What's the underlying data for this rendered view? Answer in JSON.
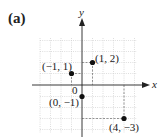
{
  "figure": {
    "panel_label": "(a)",
    "x_axis_label": "x",
    "y_axis_label": "y",
    "origin_label": "0"
  },
  "points": [
    {
      "label": "(1, 2)",
      "x": 1,
      "y": 2
    },
    {
      "label": "(−1, 1)",
      "x": -1,
      "y": 1
    },
    {
      "label": "(0, −1)",
      "x": 0,
      "y": -1
    },
    {
      "label": "(4, −3)",
      "x": 4,
      "y": -3
    }
  ],
  "colors": {
    "axis": "#222222",
    "grid": "#c8c8c8",
    "point": "#111111",
    "guide": "#555555"
  }
}
